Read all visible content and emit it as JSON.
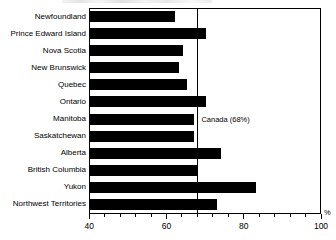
{
  "chart_data": {
    "type": "bar",
    "orientation": "horizontal",
    "title": "",
    "xlabel": "%",
    "ylabel": "",
    "xlim": [
      40,
      100
    ],
    "xticks": [
      40,
      60,
      80,
      100
    ],
    "xtick_labels": [
      "40",
      "60",
      "80",
      "100"
    ],
    "minor_tick_step": 4,
    "grid": false,
    "legend": "none",
    "bar_color": "#000000",
    "categories": [
      "Newfoundland",
      "Prince Edward Island",
      "Nova Scotia",
      "New Brunswick",
      "Quebec",
      "Ontario",
      "Manitoba",
      "Saskatchewan",
      "Alberta",
      "British Columbia",
      "Yukon",
      "Northwest Territories"
    ],
    "values": [
      62,
      70,
      64,
      63,
      65,
      70,
      67,
      67,
      74,
      68,
      83,
      73
    ],
    "annotations": [
      {
        "name": "canada-reference-line",
        "label": "Canada (68%)",
        "value": 68
      }
    ]
  },
  "axis": {
    "unit_label": "%",
    "tick_labels": [
      "40",
      "60",
      "80",
      "100"
    ]
  },
  "reference": {
    "label": "Canada (68%)"
  }
}
